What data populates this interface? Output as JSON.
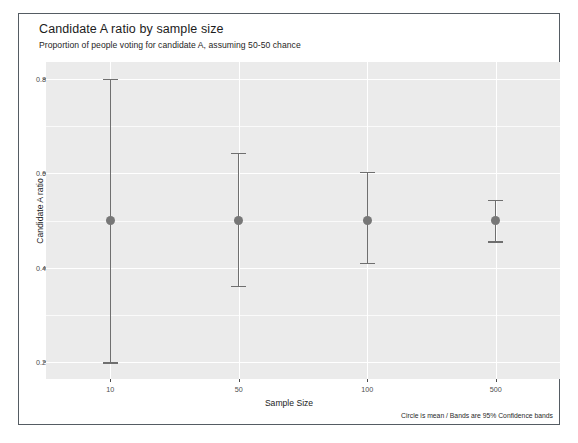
{
  "chart_data": {
    "type": "scatter",
    "title": "Candidate A ratio by sample size",
    "subtitle": "Proportion of people voting for candidate A, assuming 50-50 chance",
    "caption": "Circle is mean / Bands are 95% Confidence bands",
    "xlabel": "Sample Size",
    "ylabel": "Candidate A ratio",
    "categories": [
      "10",
      "50",
      "100",
      "500"
    ],
    "x_tick_labels": [
      "10",
      "50",
      "100",
      "500"
    ],
    "y_tick_labels": [
      "0.2",
      "0.4",
      "0.6",
      "0.8"
    ],
    "y_ticks": [
      0.2,
      0.4,
      0.6,
      0.8
    ],
    "y_minor_ticks": [
      0.3,
      0.5,
      0.7
    ],
    "ylim": [
      0.165,
      0.835
    ],
    "grid": true,
    "legend": false,
    "legend_position": "none",
    "panel_background": "#ebebeb",
    "point_color": "#777777",
    "band_color": "#6f6f6f",
    "series": [
      {
        "name": "Candidate A ratio",
        "points": [
          {
            "category": "10",
            "mean": 0.5,
            "lower": 0.2,
            "upper": 0.8
          },
          {
            "category": "50",
            "mean": 0.5,
            "lower": 0.362,
            "upper": 0.643
          },
          {
            "category": "100",
            "mean": 0.5,
            "lower": 0.411,
            "upper": 0.603
          },
          {
            "category": "500",
            "mean": 0.5,
            "lower": 0.456,
            "upper": 0.544
          }
        ]
      }
    ]
  }
}
